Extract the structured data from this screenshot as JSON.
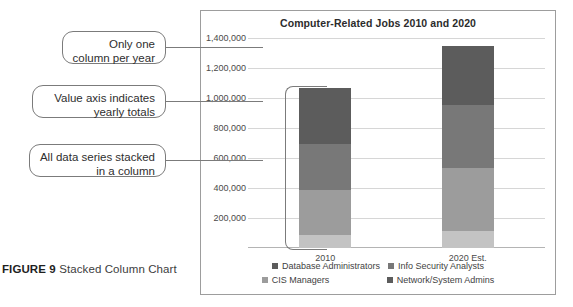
{
  "figure": {
    "label": "FIGURE 9",
    "caption": " Stacked Column Chart"
  },
  "callouts": [
    {
      "id": "one-column",
      "text": "Only one column per year"
    },
    {
      "id": "value-axis",
      "text": "Value axis indicates yearly totals"
    },
    {
      "id": "stacked",
      "text": "All data series stacked in a column"
    }
  ],
  "chart_data": {
    "type": "bar",
    "stacked": true,
    "title": "Computer-Related Jobs 2010 and 2020",
    "xlabel": "",
    "ylabel": "",
    "categories": [
      "2010",
      "2020 Est."
    ],
    "ylim": [
      0,
      1400000
    ],
    "ytick_labels": [
      "1,400,000",
      "1,200,000",
      "1,000,000",
      "800,000",
      "600,000",
      "400,000",
      "200,000"
    ],
    "ytick_values": [
      1400000,
      1200000,
      1000000,
      800000,
      600000,
      400000,
      200000
    ],
    "grid": true,
    "legend_position": "bottom",
    "series": [
      {
        "name": "Network/System Admins",
        "values": [
          90000,
          115000
        ],
        "color": "#c3c3c3"
      },
      {
        "name": "CIS Managers",
        "values": [
          300000,
          420000
        ],
        "color": "#9c9c9c"
      },
      {
        "name": "Info Security Analysts",
        "values": [
          305000,
          420000
        ],
        "color": "#787878"
      },
      {
        "name": "Database Administrators",
        "values": [
          375000,
          390000
        ],
        "color": "#5c5c5c"
      }
    ],
    "totals": [
      1070000,
      1345000
    ],
    "legend_order": [
      {
        "name": "Database Administrators",
        "color": "#5c5c5c"
      },
      {
        "name": "Info Security Analysts",
        "color": "#787878"
      },
      {
        "name": "CIS Managers",
        "color": "#9c9c9c"
      },
      {
        "name": "Network/System Admins",
        "color": "#5c5c5c"
      }
    ]
  }
}
